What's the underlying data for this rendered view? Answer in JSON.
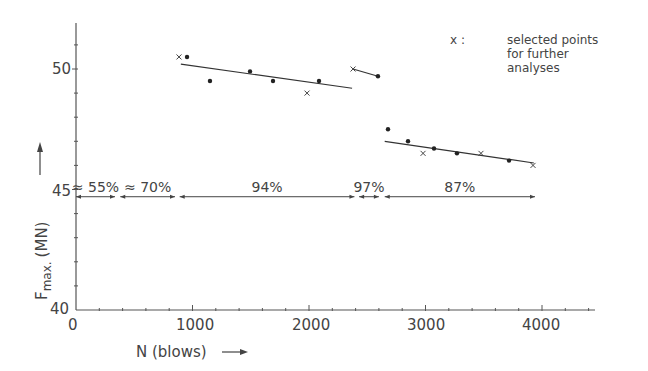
{
  "chart_data": {
    "type": "scatter",
    "title": "",
    "xlabel": "N (blows)",
    "ylabel": "F max. (MN)",
    "xlim": [
      0,
      4500
    ],
    "ylim": [
      40,
      52
    ],
    "xticks": [
      0,
      1000,
      2000,
      3000,
      4000
    ],
    "yticks": [
      40,
      45,
      50
    ],
    "grid": false,
    "legend": {
      "position": "top-right",
      "marker": "x :",
      "text": [
        "selected points",
        "for further",
        "analyses"
      ]
    },
    "series": [
      {
        "name": "group-1",
        "points": [
          {
            "x": 884,
            "y": 50.5,
            "marker": "x"
          },
          {
            "x": 953,
            "y": 50.5,
            "marker": "dot"
          },
          {
            "x": 1150,
            "y": 49.5,
            "marker": "dot"
          },
          {
            "x": 1494,
            "y": 49.9,
            "marker": "dot"
          },
          {
            "x": 1691,
            "y": 49.5,
            "marker": "dot"
          },
          {
            "x": 1983,
            "y": 49.0,
            "marker": "x"
          },
          {
            "x": 2086,
            "y": 49.5,
            "marker": "dot"
          }
        ],
        "trend": [
          [
            900,
            50.2
          ],
          [
            2370,
            49.2
          ]
        ]
      },
      {
        "name": "group-2",
        "points": [
          {
            "x": 2378,
            "y": 50.0,
            "marker": "x"
          },
          {
            "x": 2592,
            "y": 49.7,
            "marker": "dot"
          }
        ],
        "trend": [
          [
            2378,
            50.0
          ],
          [
            2592,
            49.7
          ]
        ]
      },
      {
        "name": "group-3",
        "points": [
          {
            "x": 2678,
            "y": 47.5,
            "marker": "dot"
          },
          {
            "x": 2850,
            "y": 47.0,
            "marker": "dot"
          },
          {
            "x": 2979,
            "y": 46.5,
            "marker": "x"
          },
          {
            "x": 3073,
            "y": 46.7,
            "marker": "dot"
          },
          {
            "x": 3270,
            "y": 46.5,
            "marker": "dot"
          },
          {
            "x": 3476,
            "y": 46.5,
            "marker": "x"
          },
          {
            "x": 3717,
            "y": 46.2,
            "marker": "dot"
          },
          {
            "x": 3923,
            "y": 46.0,
            "marker": "x"
          }
        ],
        "trend": [
          [
            2650,
            47.0
          ],
          [
            3930,
            46.1
          ]
        ]
      }
    ],
    "annotations": [
      {
        "label": "≈ 55%",
        "x_start": 0,
        "x_end": 335
      },
      {
        "label": "≈ 70%",
        "x_start": 380,
        "x_end": 850
      },
      {
        "label": "94%",
        "x_start": 890,
        "x_end": 2390
      },
      {
        "label": "97%",
        "x_start": 2430,
        "x_end": 2600
      },
      {
        "label": "87%",
        "x_start": 2650,
        "x_end": 3940
      }
    ],
    "annotation_y": 44.7
  },
  "axis": {
    "x_tick_labels": [
      "0",
      "1000",
      "2000",
      "3000",
      "4000"
    ],
    "y_tick_labels": [
      "40",
      "45",
      "50"
    ],
    "x_title": "N (blows)",
    "y_title_main": "F",
    "y_title_sub": "max.",
    "y_title_unit": "(MN)"
  },
  "legend": {
    "marker": "x :",
    "line1": "selected points",
    "line2": "for further",
    "line3": "analyses"
  },
  "annotations": {
    "a1": "≈ 55%",
    "a2": "≈ 70%",
    "a3": "94%",
    "a4": "97%",
    "a5": "87%"
  }
}
